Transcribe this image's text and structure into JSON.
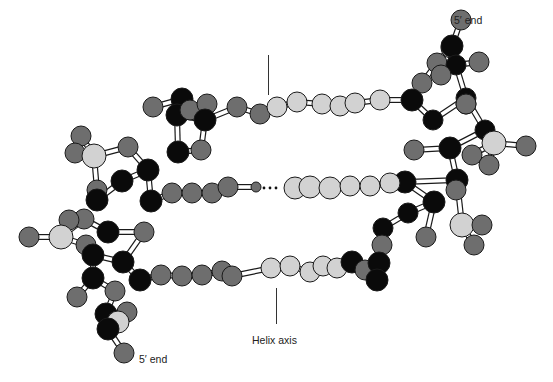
{
  "labels": {
    "five_prime_top": "5′ end",
    "five_prime_bottom": "5′ end",
    "helix_axis": "Helix axis"
  },
  "colors": {
    "black_atom": "#0a0a0a",
    "dark_atom": "#6e6e6e",
    "light_atom": "#d2d2d2",
    "outline": "#1a1a1a",
    "bond_fill": "#ffffff"
  },
  "atoms": [
    {
      "x": 461,
      "y": 20,
      "r": 10,
      "c": "dark"
    },
    {
      "x": 451,
      "y": 48,
      "r": 10,
      "c": "light"
    },
    {
      "x": 452,
      "y": 46,
      "r": 11,
      "c": "black"
    },
    {
      "x": 437,
      "y": 63,
      "r": 10,
      "c": "dark"
    },
    {
      "x": 456,
      "y": 65,
      "r": 10,
      "c": "black"
    },
    {
      "x": 479,
      "y": 62,
      "r": 10,
      "c": "dark"
    },
    {
      "x": 441,
      "y": 75,
      "r": 10,
      "c": "dark"
    },
    {
      "x": 422,
      "y": 83,
      "r": 10,
      "c": "dark"
    },
    {
      "x": 412,
      "y": 100,
      "r": 11,
      "c": "black"
    },
    {
      "x": 466,
      "y": 98,
      "r": 10,
      "c": "black"
    },
    {
      "x": 466,
      "y": 104,
      "r": 10,
      "c": "dark"
    },
    {
      "x": 433,
      "y": 120,
      "r": 10,
      "c": "black"
    },
    {
      "x": 466,
      "y": 104,
      "r": 10,
      "c": "dark"
    },
    {
      "x": 485,
      "y": 130,
      "r": 10,
      "c": "black"
    },
    {
      "x": 494,
      "y": 143,
      "r": 12,
      "c": "light"
    },
    {
      "x": 526,
      "y": 146,
      "r": 10,
      "c": "dark"
    },
    {
      "x": 472,
      "y": 155,
      "r": 10,
      "c": "dark"
    },
    {
      "x": 489,
      "y": 165,
      "r": 10,
      "c": "dark"
    },
    {
      "x": 414,
      "y": 150,
      "r": 10,
      "c": "dark"
    },
    {
      "x": 450,
      "y": 148,
      "r": 11,
      "c": "black"
    },
    {
      "x": 457,
      "y": 180,
      "r": 11,
      "c": "black"
    },
    {
      "x": 456,
      "y": 190,
      "r": 10,
      "c": "dark"
    },
    {
      "x": 405,
      "y": 182,
      "r": 11,
      "c": "black"
    },
    {
      "x": 434,
      "y": 202,
      "r": 11,
      "c": "black"
    },
    {
      "x": 462,
      "y": 225,
      "r": 12,
      "c": "light"
    },
    {
      "x": 482,
      "y": 225,
      "r": 10,
      "c": "dark"
    },
    {
      "x": 474,
      "y": 245,
      "r": 10,
      "c": "dark"
    },
    {
      "x": 408,
      "y": 213,
      "r": 10,
      "c": "black"
    },
    {
      "x": 426,
      "y": 237,
      "r": 10,
      "c": "dark"
    },
    {
      "x": 383,
      "y": 228,
      "r": 10,
      "c": "black"
    },
    {
      "x": 382,
      "y": 245,
      "r": 10,
      "c": "dark"
    },
    {
      "x": 153,
      "y": 107,
      "r": 10,
      "c": "dark"
    },
    {
      "x": 182,
      "y": 99,
      "r": 11,
      "c": "black"
    },
    {
      "x": 177,
      "y": 115,
      "r": 11,
      "c": "black"
    },
    {
      "x": 190,
      "y": 110,
      "r": 10,
      "c": "dark"
    },
    {
      "x": 207,
      "y": 104,
      "r": 10,
      "c": "dark"
    },
    {
      "x": 205,
      "y": 120,
      "r": 11,
      "c": "black"
    },
    {
      "x": 178,
      "y": 152,
      "r": 11,
      "c": "black"
    },
    {
      "x": 201,
      "y": 150,
      "r": 10,
      "c": "dark"
    },
    {
      "x": 237,
      "y": 107,
      "r": 10,
      "c": "dark"
    },
    {
      "x": 260,
      "y": 114,
      "r": 10,
      "c": "dark"
    },
    {
      "x": 277,
      "y": 107,
      "r": 10,
      "c": "light"
    },
    {
      "x": 297,
      "y": 102,
      "r": 10,
      "c": "light"
    },
    {
      "x": 322,
      "y": 104,
      "r": 10,
      "c": "light"
    },
    {
      "x": 340,
      "y": 106,
      "r": 10,
      "c": "light"
    },
    {
      "x": 355,
      "y": 103,
      "r": 10,
      "c": "light"
    },
    {
      "x": 380,
      "y": 100,
      "r": 10,
      "c": "light"
    },
    {
      "x": 81,
      "y": 136,
      "r": 10,
      "c": "dark"
    },
    {
      "x": 75,
      "y": 153,
      "r": 10,
      "c": "dark"
    },
    {
      "x": 94,
      "y": 156,
      "r": 12,
      "c": "light"
    },
    {
      "x": 128,
      "y": 147,
      "r": 10,
      "c": "dark"
    },
    {
      "x": 148,
      "y": 170,
      "r": 11,
      "c": "black"
    },
    {
      "x": 122,
      "y": 181,
      "r": 11,
      "c": "black"
    },
    {
      "x": 97,
      "y": 190,
      "r": 10,
      "c": "dark"
    },
    {
      "x": 97,
      "y": 200,
      "r": 11,
      "c": "black"
    },
    {
      "x": 151,
      "y": 201,
      "r": 11,
      "c": "black"
    },
    {
      "x": 172,
      "y": 193,
      "r": 10,
      "c": "dark"
    },
    {
      "x": 192,
      "y": 193,
      "r": 10,
      "c": "dark"
    },
    {
      "x": 212,
      "y": 193,
      "r": 10,
      "c": "dark"
    },
    {
      "x": 228,
      "y": 187,
      "r": 10,
      "c": "dark"
    },
    {
      "x": 256,
      "y": 187,
      "r": 5,
      "c": "dark"
    },
    {
      "x": 295,
      "y": 188,
      "r": 11,
      "c": "light"
    },
    {
      "x": 310,
      "y": 187,
      "r": 11,
      "c": "light"
    },
    {
      "x": 330,
      "y": 188,
      "r": 11,
      "c": "light"
    },
    {
      "x": 350,
      "y": 186,
      "r": 10,
      "c": "light"
    },
    {
      "x": 370,
      "y": 186,
      "r": 10,
      "c": "light"
    },
    {
      "x": 390,
      "y": 183,
      "r": 10,
      "c": "light"
    },
    {
      "x": 144,
      "y": 232,
      "r": 10,
      "c": "dark"
    },
    {
      "x": 108,
      "y": 232,
      "r": 11,
      "c": "black"
    },
    {
      "x": 84,
      "y": 219,
      "r": 10,
      "c": "dark"
    },
    {
      "x": 69,
      "y": 220,
      "r": 10,
      "c": "dark"
    },
    {
      "x": 61,
      "y": 237,
      "r": 12,
      "c": "light"
    },
    {
      "x": 29,
      "y": 237,
      "r": 10,
      "c": "dark"
    },
    {
      "x": 86,
      "y": 245,
      "r": 10,
      "c": "dark"
    },
    {
      "x": 93,
      "y": 255,
      "r": 11,
      "c": "black"
    },
    {
      "x": 123,
      "y": 262,
      "r": 11,
      "c": "black"
    },
    {
      "x": 93,
      "y": 278,
      "r": 11,
      "c": "black"
    },
    {
      "x": 140,
      "y": 280,
      "r": 11,
      "c": "black"
    },
    {
      "x": 77,
      "y": 297,
      "r": 10,
      "c": "dark"
    },
    {
      "x": 115,
      "y": 291,
      "r": 10,
      "c": "dark"
    },
    {
      "x": 127,
      "y": 312,
      "r": 10,
      "c": "dark"
    },
    {
      "x": 106,
      "y": 314,
      "r": 11,
      "c": "black"
    },
    {
      "x": 118,
      "y": 322,
      "r": 11,
      "c": "light"
    },
    {
      "x": 108,
      "y": 329,
      "r": 11,
      "c": "black"
    },
    {
      "x": 124,
      "y": 353,
      "r": 10,
      "c": "dark"
    },
    {
      "x": 161,
      "y": 275,
      "r": 10,
      "c": "dark"
    },
    {
      "x": 182,
      "y": 276,
      "r": 10,
      "c": "dark"
    },
    {
      "x": 202,
      "y": 275,
      "r": 10,
      "c": "dark"
    },
    {
      "x": 222,
      "y": 271,
      "r": 10,
      "c": "dark"
    },
    {
      "x": 232,
      "y": 276,
      "r": 10,
      "c": "dark"
    },
    {
      "x": 271,
      "y": 268,
      "r": 10,
      "c": "light"
    },
    {
      "x": 290,
      "y": 266,
      "r": 10,
      "c": "light"
    },
    {
      "x": 310,
      "y": 272,
      "r": 10,
      "c": "light"
    },
    {
      "x": 323,
      "y": 266,
      "r": 10,
      "c": "light"
    },
    {
      "x": 337,
      "y": 268,
      "r": 10,
      "c": "light"
    },
    {
      "x": 352,
      "y": 262,
      "r": 11,
      "c": "black"
    },
    {
      "x": 365,
      "y": 270,
      "r": 10,
      "c": "dark"
    },
    {
      "x": 379,
      "y": 263,
      "r": 11,
      "c": "black"
    },
    {
      "x": 377,
      "y": 280,
      "r": 11,
      "c": "black"
    }
  ],
  "bonds": [
    [
      0,
      2
    ],
    [
      2,
      3
    ],
    [
      2,
      4
    ],
    [
      4,
      5
    ],
    [
      3,
      7
    ],
    [
      7,
      8
    ],
    [
      4,
      9
    ],
    [
      9,
      11
    ],
    [
      8,
      11
    ],
    [
      4,
      6
    ],
    [
      9,
      13
    ],
    [
      13,
      14
    ],
    [
      14,
      15
    ],
    [
      14,
      16
    ],
    [
      14,
      17
    ],
    [
      18,
      19
    ],
    [
      19,
      20
    ],
    [
      20,
      22
    ],
    [
      22,
      23
    ],
    [
      23,
      27
    ],
    [
      19,
      13
    ],
    [
      20,
      24
    ],
    [
      24,
      25
    ],
    [
      24,
      26
    ],
    [
      23,
      28
    ],
    [
      27,
      29
    ],
    [
      29,
      30
    ],
    [
      31,
      32
    ],
    [
      32,
      33
    ],
    [
      33,
      36
    ],
    [
      36,
      38
    ],
    [
      37,
      38
    ],
    [
      33,
      37
    ],
    [
      36,
      39
    ],
    [
      39,
      40
    ],
    [
      40,
      41
    ],
    [
      41,
      42
    ],
    [
      42,
      43
    ],
    [
      43,
      44
    ],
    [
      44,
      45
    ],
    [
      45,
      46
    ],
    [
      46,
      8
    ],
    [
      47,
      49
    ],
    [
      48,
      49
    ],
    [
      49,
      50
    ],
    [
      50,
      51
    ],
    [
      49,
      53
    ],
    [
      53,
      54
    ],
    [
      51,
      52
    ],
    [
      51,
      55
    ],
    [
      52,
      54
    ],
    [
      55,
      56
    ],
    [
      56,
      57
    ],
    [
      57,
      58
    ],
    [
      58,
      59
    ],
    [
      59,
      60
    ],
    [
      61,
      62
    ],
    [
      62,
      63
    ],
    [
      63,
      64
    ],
    [
      64,
      65
    ],
    [
      65,
      66
    ],
    [
      66,
      22
    ],
    [
      67,
      68
    ],
    [
      68,
      69
    ],
    [
      69,
      71
    ],
    [
      70,
      71
    ],
    [
      71,
      72
    ],
    [
      71,
      73
    ],
    [
      73,
      74
    ],
    [
      74,
      75
    ],
    [
      75,
      67
    ],
    [
      74,
      76
    ],
    [
      75,
      77
    ],
    [
      76,
      79
    ],
    [
      76,
      78
    ],
    [
      79,
      81
    ],
    [
      81,
      80
    ],
    [
      81,
      82
    ],
    [
      82,
      83
    ],
    [
      83,
      84
    ],
    [
      77,
      85
    ],
    [
      85,
      86
    ],
    [
      86,
      87
    ],
    [
      87,
      88
    ],
    [
      88,
      89
    ],
    [
      89,
      90
    ],
    [
      90,
      91
    ],
    [
      91,
      92
    ],
    [
      92,
      93
    ],
    [
      93,
      94
    ],
    [
      94,
      95
    ],
    [
      95,
      96
    ],
    [
      96,
      97
    ],
    [
      97,
      98
    ]
  ]
}
